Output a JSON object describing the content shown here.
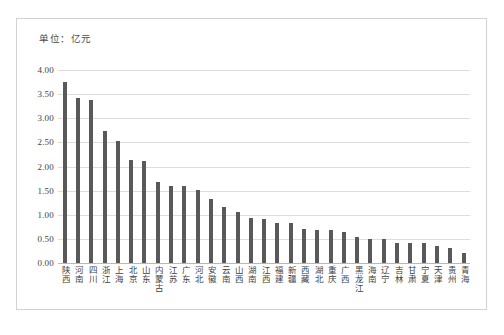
{
  "figure": {
    "unit_note": "单位：亿元"
  },
  "chart_data": {
    "type": "bar",
    "title": "",
    "subtitle": "",
    "xlabel": "",
    "ylabel": "",
    "unit_note": "单位：亿元",
    "ylim": [
      0.0,
      4.0
    ],
    "ytick_labels": [
      "4.00",
      "3.50",
      "3.00",
      "2.50",
      "2.00",
      "1.50",
      "1.00",
      "0.50",
      "0.00"
    ],
    "ytick_values": [
      4.0,
      3.5,
      3.0,
      2.5,
      2.0,
      1.5,
      1.0,
      0.5,
      0.0
    ],
    "grid": true,
    "legend": false,
    "legend_position": "none",
    "bar_color": "#595959",
    "grid_color": "#dcdcdc",
    "categories": [
      "陕西",
      "河南",
      "四川",
      "浙江",
      "上海",
      "北京",
      "山东",
      "内蒙古",
      "江苏",
      "广东",
      "河北",
      "安徽",
      "云南",
      "山西",
      "湖南",
      "江西",
      "福建",
      "新疆",
      "西藏",
      "湖北",
      "重庆",
      "广西",
      "黑龙江",
      "海南",
      "辽宁",
      "吉林",
      "甘肃",
      "宁夏",
      "天津",
      "贵州",
      "青海"
    ],
    "values": [
      3.75,
      3.43,
      3.38,
      2.73,
      2.52,
      2.14,
      2.12,
      1.68,
      1.6,
      1.6,
      1.52,
      1.32,
      1.16,
      1.06,
      0.94,
      0.91,
      0.82,
      0.82,
      0.7,
      0.68,
      0.68,
      0.65,
      0.53,
      0.5,
      0.5,
      0.42,
      0.41,
      0.41,
      0.36,
      0.32,
      0.21
    ]
  }
}
